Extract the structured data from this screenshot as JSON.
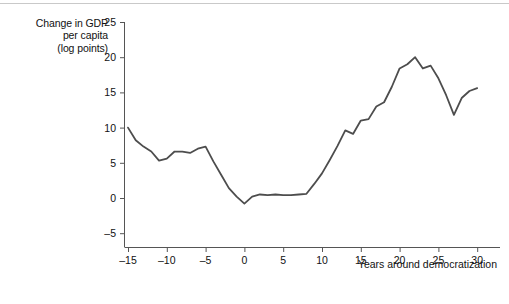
{
  "chart_data": {
    "type": "line",
    "title": "",
    "ylabel_lines": [
      "Change in GDP",
      "per capita",
      "(log points)"
    ],
    "xlabel": "Years around democratization",
    "xlim": [
      -15,
      31
    ],
    "ylim": [
      -5,
      25
    ],
    "xticks": [
      -15,
      -10,
      -5,
      0,
      5,
      10,
      15,
      20,
      25,
      30
    ],
    "xtick_labels": [
      "–15",
      "–10",
      "–5",
      "0",
      "5",
      "10",
      "15",
      "20",
      "25",
      "30"
    ],
    "yticks": [
      -5,
      0,
      5,
      10,
      15,
      20,
      25
    ],
    "ytick_labels": [
      "–5",
      "0",
      "5",
      "10",
      "15",
      "20",
      "25"
    ],
    "grid": false,
    "legend": "none",
    "line_color": "#4d4d4d",
    "line_width": 1.8,
    "series": [
      {
        "name": "Change in GDP per capita",
        "x": [
          -15,
          -14,
          -13,
          -12,
          -11,
          -10,
          -9,
          -8,
          -7,
          -6,
          -5,
          -4,
          -3,
          -2,
          -1,
          0,
          1,
          2,
          3,
          4,
          5,
          6,
          7,
          8,
          9,
          10,
          11,
          12,
          13,
          14,
          15,
          16,
          17,
          18,
          19,
          20,
          21,
          22,
          23,
          24,
          25,
          26,
          27,
          28,
          29,
          30
        ],
        "values": [
          10.0,
          8.2,
          7.3,
          6.6,
          5.3,
          5.6,
          6.6,
          6.6,
          6.4,
          7.0,
          7.3,
          5.2,
          3.3,
          1.4,
          0.2,
          -0.8,
          0.2,
          0.5,
          0.4,
          0.5,
          0.4,
          0.4,
          0.5,
          0.6,
          2.0,
          3.5,
          5.4,
          7.4,
          9.6,
          9.1,
          11.0,
          11.2,
          13.0,
          13.6,
          15.8,
          18.4,
          19.0,
          20.0,
          18.4,
          18.8,
          17.0,
          14.6,
          11.8,
          14.2,
          15.2,
          15.6
        ]
      }
    ]
  },
  "caption_fragment": ""
}
